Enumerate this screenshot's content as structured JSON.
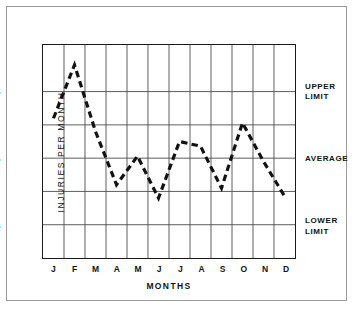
{
  "chart_data": {
    "type": "line",
    "title": "",
    "xlabel": "MONTHS",
    "ylabel": "INJURIES  PER  MONTH",
    "categories": [
      "J",
      "F",
      "M",
      "A",
      "M",
      "J",
      "J",
      "A",
      "S",
      "O",
      "N",
      "D"
    ],
    "values": [
      31,
      39,
      29,
      21,
      25.3,
      19,
      27.5,
      26.8,
      20.5,
      30.3,
      24.5,
      19.3
    ],
    "series": [
      {
        "name": "Injuries per month",
        "values": [
          31,
          39,
          29,
          21,
          25.3,
          19,
          27.5,
          26.8,
          20.5,
          30.3,
          24.5,
          19.3
        ],
        "style": "dashed",
        "color": "#111111"
      }
    ],
    "ylim": [
      10,
      42
    ],
    "xlim": [
      0,
      12
    ],
    "y_ticks": [
      35,
      25,
      15
    ],
    "y_tick_labels": [
      "35",
      "25",
      "15"
    ],
    "y_gridlines": [
      35,
      30,
      25,
      20,
      15
    ],
    "x_gridlines": 12,
    "grid": true,
    "legend": "none",
    "annotations": [
      {
        "id": "upper-limit",
        "text": "UPPER\nLIMIT",
        "y": 35,
        "position": "right"
      },
      {
        "id": "average",
        "text": "AVERAGE",
        "y": 25,
        "position": "right"
      },
      {
        "id": "lower-limit",
        "text": "LOWER\nLIMIT",
        "y": 15,
        "position": "right"
      }
    ]
  },
  "axis": {
    "y_label": "INJURIES  PER  MONTH",
    "x_label": "MONTHS",
    "y_ticks": [
      {
        "label": "35",
        "value": 35
      },
      {
        "label": "25",
        "value": 25
      },
      {
        "label": "15",
        "value": 15
      }
    ],
    "x_ticks": [
      {
        "label": "J",
        "value": 0
      },
      {
        "label": "F",
        "value": 1
      },
      {
        "label": "M",
        "value": 2
      },
      {
        "label": "A",
        "value": 3
      },
      {
        "label": "M",
        "value": 4
      },
      {
        "label": "J",
        "value": 5
      },
      {
        "label": "J",
        "value": 6
      },
      {
        "label": "A",
        "value": 7
      },
      {
        "label": "S",
        "value": 8
      },
      {
        "label": "O",
        "value": 9
      },
      {
        "label": "N",
        "value": 10
      },
      {
        "label": "D",
        "value": 11
      }
    ]
  },
  "limits": {
    "upper": "UPPER\nLIMIT",
    "average": "AVERAGE",
    "lower": "LOWER\nLIMIT"
  },
  "colors": {
    "frame": "#9a9a9a",
    "axis": "#1a1a1a",
    "grid": "#4a4a4a",
    "series": "#111111",
    "background": "#ffffff"
  }
}
